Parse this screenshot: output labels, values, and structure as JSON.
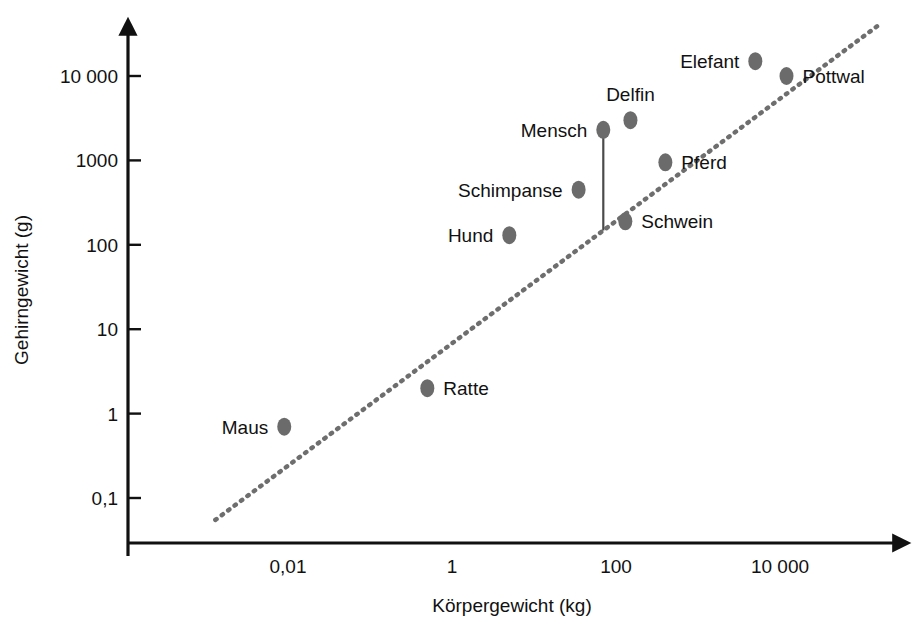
{
  "chart_data": {
    "type": "scatter",
    "title": "",
    "xlabel": "Körpergewicht (kg)",
    "ylabel": "Gehirngewicht (g)",
    "xscale": "log",
    "yscale": "log",
    "grid": false,
    "legend": "none",
    "xticklabels": [
      "0,01",
      "1",
      "100",
      "10 000"
    ],
    "xtickvalues": [
      0.01,
      1,
      100,
      10000
    ],
    "yticklabels": [
      "10 000",
      "1000",
      "100",
      "10",
      "1",
      "0,1"
    ],
    "ytickvalues": [
      10000,
      1000,
      100,
      10,
      1,
      0.1
    ],
    "xlim": [
      0.0006,
      400000
    ],
    "ylim": [
      0.03,
      60000
    ],
    "points": [
      {
        "label": "Maus",
        "x": 0.009,
        "y": 0.7,
        "label_side": "left"
      },
      {
        "label": "Ratte",
        "x": 0.5,
        "y": 2.0,
        "label_side": "right"
      },
      {
        "label": "Hund",
        "x": 5.0,
        "y": 130.0,
        "label_side": "left"
      },
      {
        "label": "Schimpanse",
        "x": 35.0,
        "y": 450.0,
        "label_side": "left"
      },
      {
        "label": "Mensch",
        "x": 70.0,
        "y": 2300.0,
        "label_side": "left"
      },
      {
        "label": "Delfin",
        "x": 150.0,
        "y": 3000.0,
        "label_side": "above"
      },
      {
        "label": "Schwein",
        "x": 130.0,
        "y": 190.0,
        "label_side": "right"
      },
      {
        "label": "Pferd",
        "x": 400.0,
        "y": 950.0,
        "label_side": "right"
      },
      {
        "label": "Elefant",
        "x": 5000.0,
        "y": 15000.0,
        "label_side": "left"
      },
      {
        "label": "Pottwal",
        "x": 12000.0,
        "y": 10000.0,
        "label_side": "right"
      }
    ],
    "trend_line": {
      "style": "dotted",
      "from": {
        "x": 0.0013,
        "y": 0.055
      },
      "to": {
        "x": 170000.0,
        "y": 42000.0
      }
    },
    "annotations": [
      {
        "type": "connector",
        "from_point": "Mensch",
        "to": "trend-line",
        "description": "vertical line from Mensch marker down to regression line"
      }
    ],
    "colors": {
      "marker": "#6b6b6b",
      "trend": "#6e6e6e",
      "axis": "#111111",
      "text": "#111111",
      "background": "#ffffff"
    }
  }
}
